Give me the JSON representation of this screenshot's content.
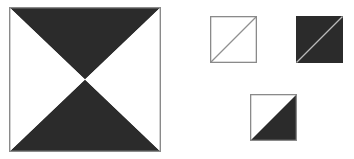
{
  "canvas": {
    "width": 354,
    "height": 159,
    "background_color": "#ffffff"
  },
  "colors": {
    "dark_fill": "#2b2b2b",
    "light_fill": "#ffffff",
    "border_gray": "#8a8a8a",
    "diagonal_gray": "#909090",
    "diagonal_light": "#b9b9b9",
    "background": "#ffffff"
  },
  "figures": {
    "main_square": {
      "name": "bowtie-x-square",
      "x": 9,
      "y": 7,
      "width": 152,
      "height": 145,
      "border_color": "#8a8a8a",
      "border_width": 1.4,
      "background_color": "#ffffff",
      "regions": [
        {
          "label": "top-triangle",
          "fill": "#2b2b2b",
          "points": "0,0 152,0 76,72.5"
        },
        {
          "label": "bottom-triangle",
          "fill": "#2b2b2b",
          "points": "0,145 152,145 76,72.5"
        },
        {
          "label": "left-triangle",
          "fill": "#ffffff",
          "points": "0,0 0,145 76,72.5"
        },
        {
          "label": "right-triangle",
          "fill": "#ffffff",
          "points": "152,0 152,145 76,72.5"
        }
      ]
    },
    "small_squares": [
      {
        "name": "outline-square-with-diagonal",
        "x": 210,
        "y": 16,
        "width": 47,
        "height": 47,
        "fill": "#ffffff",
        "border_color": "#8a8a8a",
        "border_width": 1.3,
        "diagonal": {
          "from": "bottom-left",
          "to": "top-right",
          "color": "#909090",
          "width": 1.3
        }
      },
      {
        "name": "dark-square-with-light-diagonal",
        "x": 296,
        "y": 16,
        "width": 47,
        "height": 47,
        "fill": "#2b2b2b",
        "border_color": "#2b2b2b",
        "border_width": 0,
        "diagonal": {
          "from": "bottom-left",
          "to": "top-right",
          "color": "#b9b9b9",
          "width": 1.3
        }
      },
      {
        "name": "half-split-square",
        "x": 250,
        "y": 94,
        "width": 47,
        "height": 47,
        "fill": "#ffffff",
        "border_color": "#8a8a8a",
        "border_width": 1.3,
        "split": {
          "diagonal_from": "bottom-left",
          "diagonal_to": "top-right",
          "upper_left_fill": "#ffffff",
          "lower_right_fill": "#2b2b2b"
        }
      }
    ]
  }
}
